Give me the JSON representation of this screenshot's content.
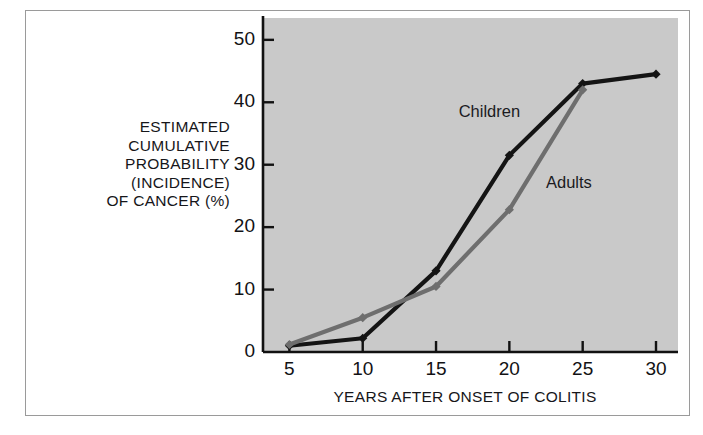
{
  "figure": {
    "background_color": "#ffffff",
    "frame_color": "#9a9a9a",
    "plot_background_color": "#c9c9c9"
  },
  "chart_data": {
    "type": "line",
    "title": "",
    "subtitle": "",
    "xlabel": "YEARS AFTER ONSET OF COLITIS",
    "ylabel": "ESTIMATED CUMULATIVE PROBABILITY (INCIDENCE) OF CANCER (%)",
    "ylabel_lines": [
      "ESTIMATED",
      "CUMULATIVE",
      "PROBABILITY",
      "(INCIDENCE)",
      "OF CANCER (%)"
    ],
    "x": [
      5,
      10,
      15,
      20,
      25,
      30
    ],
    "xlim": [
      3.2,
      31.5
    ],
    "ylim": [
      0,
      53.5
    ],
    "xticks": [
      5,
      10,
      15,
      20,
      25,
      30
    ],
    "xtick_labels": [
      "5",
      "10",
      "15",
      "20",
      "25",
      "30"
    ],
    "yticks": [
      0,
      10,
      20,
      30,
      40,
      50
    ],
    "ytick_labels": [
      "0",
      "10",
      "20",
      "30",
      "40",
      "50"
    ],
    "grid": false,
    "legend_position": "inline-annotation",
    "series": [
      {
        "name": "Children",
        "color": "#141414",
        "marker": "diamond",
        "x": [
          5,
          10,
          15,
          20,
          25,
          30
        ],
        "values": [
          1.0,
          2.2,
          13.0,
          31.5,
          43.0,
          44.5
        ]
      },
      {
        "name": "Adults",
        "color": "#6e6e6e",
        "marker": "diamond",
        "x": [
          5,
          10,
          15,
          20,
          25
        ],
        "values": [
          1.2,
          5.5,
          10.5,
          22.8,
          42.0
        ]
      }
    ],
    "annotations": [
      {
        "text": "Children",
        "x": 19.0,
        "y": 38.5
      },
      {
        "text": "Adults",
        "x": 24.0,
        "y": 27.0
      }
    ]
  }
}
